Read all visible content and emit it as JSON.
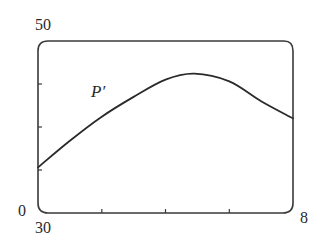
{
  "chart_data": {
    "type": "line",
    "title": "",
    "xlabel": "",
    "ylabel": "",
    "xlim": [
      0,
      8
    ],
    "ylim": [
      30,
      50
    ],
    "x_tick_labels": [
      "0",
      "8"
    ],
    "y_tick_labels": [
      "30",
      "50"
    ],
    "x_ticks": [
      0,
      2,
      4,
      6,
      8
    ],
    "y_ticks": [
      30,
      35,
      40,
      45,
      50
    ],
    "grid": false,
    "legend": "none",
    "series": [
      {
        "name": "P'",
        "x": [
          0,
          1,
          2,
          3,
          4,
          4.9,
          6,
          7,
          8
        ],
        "values": [
          35.3,
          38.4,
          41.2,
          43.5,
          45.5,
          46.2,
          45.3,
          43.0,
          41.0
        ]
      }
    ],
    "annotations": [
      {
        "text": "P'",
        "x": 1.8,
        "y": 44.2
      }
    ]
  },
  "labels": {
    "y_max": "50",
    "y_min": "30",
    "x_min": "0",
    "x_max": "8",
    "series": "P′"
  },
  "style": {
    "line_color": "#2a2a2a",
    "frame_color": "#3a3a3a"
  }
}
